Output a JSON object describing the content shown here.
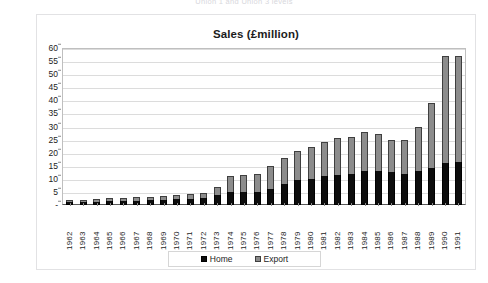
{
  "top_caption": "Union 1 and Union 3 levels",
  "chart": {
    "title": "Sales (£million)",
    "legend": {
      "home_label": "Home",
      "export_label": "Export",
      "home_color": "#0d0d0d",
      "export_color": "#8c8c8c"
    }
  },
  "chart_data": {
    "type": "bar",
    "stacked": true,
    "title": "Sales (£million)",
    "xlabel": "",
    "ylabel": "",
    "ylim": [
      0,
      60
    ],
    "ytick_step": 5,
    "ytick_labels": [
      "60",
      "55",
      "50",
      "45",
      "40",
      "35",
      "30",
      "25",
      "20",
      "15",
      "10",
      "5",
      "-"
    ],
    "grid": true,
    "legend_position": "bottom",
    "categories": [
      "1962",
      "1963",
      "1964",
      "1965",
      "1966",
      "1967",
      "1968",
      "1969",
      "1970",
      "1971",
      "1972",
      "1973",
      "1974",
      "1975",
      "1976",
      "1977",
      "1978",
      "1979",
      "1980",
      "1981",
      "1982",
      "1983",
      "1984",
      "1985",
      "1986",
      "1987",
      "1988",
      "1989",
      "1990",
      "1991"
    ],
    "series": [
      {
        "name": "Home",
        "color": "#0d0d0d",
        "values": [
          1.0,
          1.2,
          1.3,
          1.4,
          1.5,
          1.7,
          1.8,
          2.0,
          2.2,
          2.4,
          2.6,
          4.0,
          5.0,
          5.0,
          5.0,
          6.0,
          8.0,
          9.5,
          10.0,
          11.0,
          11.5,
          12.0,
          13.0,
          13.0,
          12.5,
          12.0,
          13.0,
          14.0,
          16.0,
          16.5
        ]
      },
      {
        "name": "Export",
        "color": "#8c8c8c",
        "values": [
          0.8,
          0.9,
          1.0,
          1.1,
          1.2,
          1.3,
          1.4,
          1.5,
          1.6,
          1.8,
          2.0,
          3.0,
          6.0,
          6.5,
          7.0,
          9.0,
          10.0,
          11.0,
          12.0,
          13.0,
          14.0,
          14.0,
          15.0,
          14.0,
          12.5,
          13.0,
          17.0,
          25.0,
          41.0,
          40.5
        ]
      }
    ],
    "totals": [
      1.8,
      2.1,
      2.3,
      2.5,
      2.7,
      3.0,
      3.2,
      3.5,
      3.8,
      4.2,
      4.6,
      7.0,
      11.0,
      11.5,
      12.0,
      15.0,
      18.0,
      20.5,
      22.0,
      24.0,
      25.5,
      26.0,
      28.0,
      27.0,
      25.0,
      25.0,
      30.0,
      39.0,
      57.0,
      57.0
    ]
  }
}
